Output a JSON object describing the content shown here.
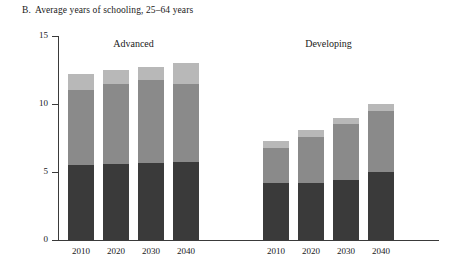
{
  "title": {
    "label": "B.",
    "text": "Average years of schooling, 25–64 years"
  },
  "axes": {
    "ylabel": "Average years of schooling",
    "yticks": [
      "15",
      "10",
      "5",
      "0"
    ],
    "ymin": 0,
    "ymax": 15
  },
  "groups": [
    {
      "label": "Advanced"
    },
    {
      "label": "Developing"
    }
  ],
  "xlabels": [
    "2010",
    "2020",
    "2030",
    "2040"
  ],
  "colors": {
    "low": "#3a3a3a",
    "medium": "#8a8a8a",
    "high": "#b8b8b8",
    "axis": "#3a3a3a",
    "background": "#ffffff"
  },
  "chart_data": {
    "type": "bar",
    "xlabel": "",
    "ylabel": "Average years of schooling",
    "ylim": [
      0,
      15
    ],
    "yticks": [
      0,
      5,
      10,
      15
    ],
    "grid": false,
    "legend": "none",
    "stacked": true,
    "panels": [
      {
        "name": "Advanced",
        "categories": [
          "2010",
          "2020",
          "2030",
          "2040"
        ],
        "series": [
          {
            "name": "low",
            "values": [
              5.5,
              5.6,
              5.65,
              5.7
            ]
          },
          {
            "name": "medium",
            "values": [
              5.5,
              5.9,
              6.1,
              5.8
            ]
          },
          {
            "name": "high",
            "values": [
              1.2,
              1.0,
              0.95,
              1.5
            ]
          }
        ],
        "totals": [
          12.2,
          12.5,
          12.7,
          13.0
        ]
      },
      {
        "name": "Developing",
        "categories": [
          "2010",
          "2020",
          "2030",
          "2040"
        ],
        "series": [
          {
            "name": "low",
            "values": [
              4.2,
              4.2,
              4.4,
              5.0
            ]
          },
          {
            "name": "medium",
            "values": [
              2.6,
              3.4,
              4.1,
              4.5
            ]
          },
          {
            "name": "high",
            "values": [
              0.5,
              0.5,
              0.5,
              0.5
            ]
          }
        ],
        "totals": [
          7.3,
          8.1,
          9.0,
          10.0
        ]
      }
    ]
  }
}
